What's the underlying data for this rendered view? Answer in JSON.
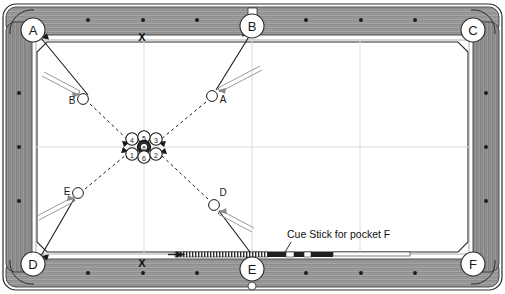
{
  "diagram": {
    "surface_color": "#ffffff",
    "rail_color": "#9a9a9a",
    "rail_dark_color": "#6f6f6f",
    "grid_color": "#d8d8d8",
    "line_color": "#1a1a1a",
    "ball_fill": "#ffffff",
    "eight_ball_fill": "#2a2a2a"
  },
  "pockets": [
    {
      "id": "pocket-a",
      "label": "A",
      "x": 33,
      "y": 30,
      "type": "corner"
    },
    {
      "id": "pocket-b",
      "label": "B",
      "x": 252,
      "y": 26,
      "type": "side"
    },
    {
      "id": "pocket-c",
      "label": "C",
      "x": 473,
      "y": 30,
      "type": "corner"
    },
    {
      "id": "pocket-d",
      "label": "D",
      "x": 33,
      "y": 264,
      "type": "corner"
    },
    {
      "id": "pocket-e",
      "label": "E",
      "x": 252,
      "y": 269,
      "type": "side"
    },
    {
      "id": "pocket-f",
      "label": "F",
      "x": 473,
      "y": 264,
      "type": "corner"
    }
  ],
  "rail_marks": [
    {
      "id": "mark-top",
      "label": "X",
      "x": 142,
      "y": 36
    },
    {
      "id": "mark-bottom",
      "label": "X",
      "x": 142,
      "y": 262
    }
  ],
  "cue_balls": [
    {
      "id": "ball-b",
      "label": "B",
      "x": 83,
      "y": 99,
      "label_dx": -11,
      "label_dy": 5,
      "target_pocket": "A"
    },
    {
      "id": "ball-a",
      "label": "A",
      "x": 212,
      "y": 96,
      "label_dx": 11,
      "label_dy": 7,
      "target_pocket": "B"
    },
    {
      "id": "ball-e",
      "label": "E",
      "x": 78,
      "y": 193,
      "label_dx": -11,
      "label_dy": 2,
      "target_pocket": "D"
    },
    {
      "id": "ball-d",
      "label": "D",
      "x": 214,
      "y": 205,
      "label_dx": 9,
      "label_dy": -9,
      "target_pocket": "F"
    }
  ],
  "cluster": {
    "center_x": 144,
    "center_y": 145,
    "ball_radius": 6.2,
    "balls": [
      {
        "id": "ball-4",
        "label": "4",
        "x": 132,
        "y": 139,
        "dark": false
      },
      {
        "id": "ball-5",
        "label": "5",
        "x": 144,
        "y": 137,
        "dark": false
      },
      {
        "id": "ball-3",
        "label": "3",
        "x": 156,
        "y": 139,
        "dark": false
      },
      {
        "id": "ball-8",
        "label": "8",
        "x": 144,
        "y": 147,
        "dark": true
      },
      {
        "id": "ball-1",
        "label": "1",
        "x": 132,
        "y": 154,
        "dark": false
      },
      {
        "id": "ball-6",
        "label": "6",
        "x": 144,
        "y": 157,
        "dark": false
      },
      {
        "id": "ball-2",
        "label": "2",
        "x": 156,
        "y": 154,
        "dark": false
      }
    ]
  },
  "annotations": [
    {
      "id": "cue-stick-note",
      "text": "Cue Stick for pocket F",
      "x": 287,
      "y": 238
    }
  ],
  "table_cue_stick": {
    "id": "resting-cue-stick",
    "tip_x": 175,
    "tip_y": 255,
    "butt_x": 410,
    "butt_y": 255
  }
}
